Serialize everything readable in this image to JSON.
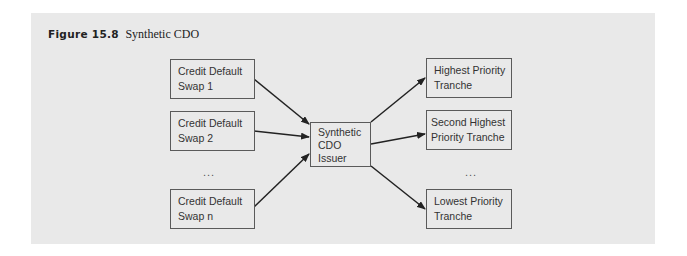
{
  "figure": {
    "number": "Figure 15.8",
    "title": "Synthetic CDO"
  },
  "diagram": {
    "inputs": [
      {
        "line1": "Credit Default",
        "line2": "Swap 1"
      },
      {
        "line1": "Credit Default",
        "line2": "Swap 2"
      },
      {
        "line1": "Credit Default",
        "line2": "Swap n"
      }
    ],
    "inputs_ellipsis": "...",
    "center": {
      "line1": "Synthetic",
      "line2": "CDO",
      "line3": "Issuer"
    },
    "outputs": [
      {
        "line1": "Highest Priority",
        "line2": "Tranche"
      },
      {
        "line1": "Second Highest",
        "line2": "Priority Tranche"
      },
      {
        "line1": "Lowest Priority",
        "line2": "Tranche"
      }
    ],
    "outputs_ellipsis": "...",
    "colors": {
      "background": "#e9e9e9",
      "border": "#5a5a5a",
      "arrow": "#222222"
    }
  }
}
